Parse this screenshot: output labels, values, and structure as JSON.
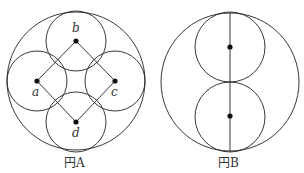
{
  "figures": [
    {
      "id": "A",
      "caption": "円A",
      "outer_circle": {
        "cx": 76,
        "cy": 81,
        "r": 69
      },
      "points": [
        {
          "label": "b",
          "x": 76,
          "y": 41
        },
        {
          "label": "a",
          "x": 37,
          "y": 81
        },
        {
          "label": "c",
          "x": 115,
          "y": 81
        },
        {
          "label": "d",
          "x": 76,
          "y": 122
        }
      ],
      "inner_circle_r": 30
    },
    {
      "id": "B",
      "caption": "円B",
      "outer_circle": {
        "cx": 230,
        "cy": 82,
        "r": 69
      },
      "points": [
        {
          "x": 230,
          "y": 47
        },
        {
          "x": 230,
          "y": 116
        }
      ],
      "inner_circle_r": 35
    }
  ],
  "colors": {
    "line": "#222222",
    "dot": "#111111",
    "text": "#333333"
  }
}
